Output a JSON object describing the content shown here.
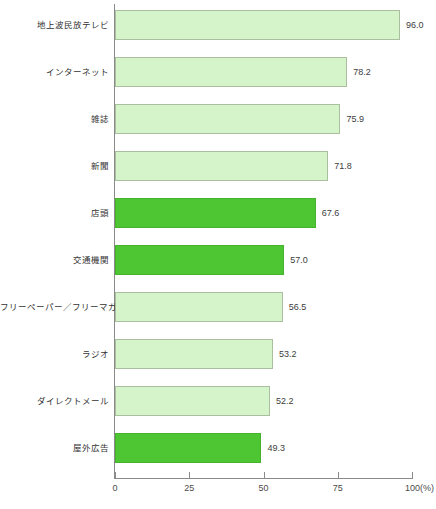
{
  "chart_data": {
    "type": "bar",
    "orientation": "horizontal",
    "title": "",
    "subtitle": "",
    "xlabel": "(%)",
    "ylabel": "",
    "xlim": [
      0,
      100
    ],
    "grid": false,
    "legend": null,
    "tick_labels": [
      "0",
      "25",
      "50",
      "75",
      "100(%)"
    ],
    "tick_values": [
      0,
      25,
      50,
      75,
      100
    ],
    "categories": [
      "地上波民放テレビ",
      "インターネット",
      "雑誌",
      "新聞",
      "店頭",
      "交通機関",
      "フリーペーパー／フリーマガジン",
      "ラジオ",
      "ダイレクトメール",
      "屋外広告"
    ],
    "values": [
      96.0,
      78.2,
      75.9,
      71.8,
      67.6,
      57.0,
      56.5,
      53.2,
      52.2,
      49.3
    ],
    "value_labels": [
      "96.0",
      "78.2",
      "75.9",
      "71.8",
      "67.6",
      "57.0",
      "56.5",
      "53.2",
      "52.2",
      "49.3"
    ],
    "highlighted": [
      false,
      false,
      false,
      false,
      true,
      true,
      false,
      false,
      false,
      true
    ],
    "colors": {
      "bar_light_fill": "#d6f4c9",
      "bar_light_border": "#a9bfa0",
      "bar_dark_fill": "#4ec634",
      "bar_dark_border": "#46b32e",
      "axis": "#8a8a8a",
      "text": "#333333"
    }
  }
}
